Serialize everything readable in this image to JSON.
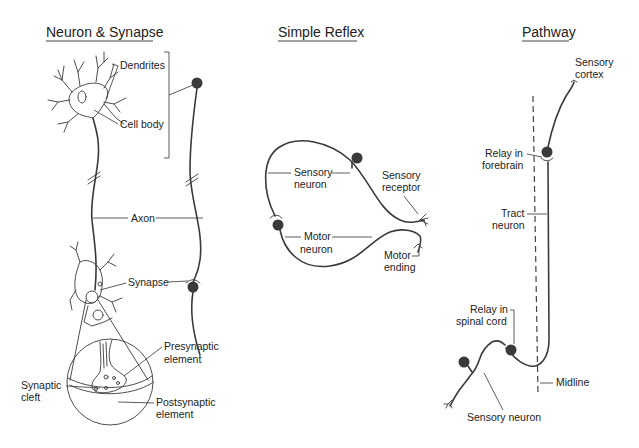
{
  "panels": {
    "neuron_synapse": {
      "title": "Neuron & Synapse",
      "labels": {
        "dendrites": "Dendrites",
        "cell_body": "Cell body",
        "axon": "Axon",
        "synapse": "Synapse",
        "presynaptic_1": "Presynaptic",
        "presynaptic_2": "element",
        "synaptic_cleft_1": "Synaptic",
        "synaptic_cleft_2": "cleft",
        "postsynaptic_1": "Postsynaptic",
        "postsynaptic_2": "element"
      }
    },
    "simple_reflex": {
      "title": "Simple Reflex",
      "labels": {
        "sensory_neuron_1": "Sensory",
        "sensory_neuron_2": "neuron",
        "sensory_receptor_1": "Sensory",
        "sensory_receptor_2": "receptor",
        "motor_neuron_1": "Motor",
        "motor_neuron_2": "neuron",
        "motor_ending_1": "Motor",
        "motor_ending_2": "ending"
      }
    },
    "pathway": {
      "title": "Pathway",
      "labels": {
        "sensory_cortex_1": "Sensory",
        "sensory_cortex_2": "cortex",
        "relay_forebrain_1": "Relay in",
        "relay_forebrain_2": "forebrain",
        "tract_neuron_1": "Tract",
        "tract_neuron_2": "neuron",
        "relay_spinal_1": "Relay in",
        "relay_spinal_2": "spinal cord",
        "midline": "Midline",
        "sensory_neuron": "Sensory neuron"
      }
    }
  }
}
